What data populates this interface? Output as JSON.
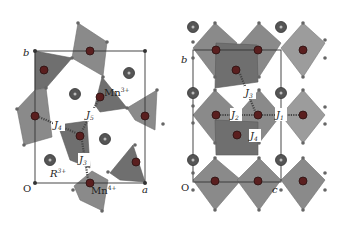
{
  "figure": {
    "panels": [
      {
        "id": "left",
        "view": "ab-plane projection",
        "axes": {
          "origin": "O",
          "x_axis": "a",
          "y_axis": "b"
        },
        "ion_labels": {
          "mn3": "Mn",
          "mn3_charge": "3+",
          "mn4": "Mn",
          "mn4_charge": "4+",
          "rare_earth": "R",
          "rare_earth_charge": "3+"
        },
        "exchange_labels": [
          "J3",
          "J4",
          "J5"
        ],
        "j_labels": {
          "j3": {
            "base": "J",
            "sub": "3"
          },
          "j4": {
            "base": "J",
            "sub": "4"
          },
          "j5": {
            "base": "J",
            "sub": "5"
          }
        }
      },
      {
        "id": "right",
        "view": "bc-plane projection",
        "axes": {
          "origin": "O",
          "x_axis": "c",
          "y_axis": "b"
        },
        "exchange_labels": [
          "J1",
          "J2",
          "J3",
          "J4"
        ],
        "j_labels": {
          "j1": {
            "base": "J",
            "sub": "1"
          },
          "j2": {
            "base": "J",
            "sub": "2"
          },
          "j3": {
            "base": "J",
            "sub": "3"
          },
          "j4": {
            "base": "J",
            "sub": "4"
          }
        }
      }
    ],
    "colors": {
      "polyhedron": "#8a8a8a",
      "mn_ion": "#5a1f1f",
      "r_ion": "#555555",
      "cell_edge": "#333333"
    }
  }
}
